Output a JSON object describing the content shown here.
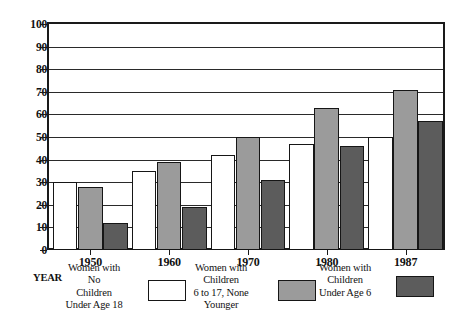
{
  "chart_data": {
    "type": "bar",
    "title": "",
    "subtitle": "",
    "xlabel": "YEAR",
    "ylabel": "",
    "categories": [
      "1950",
      "1960",
      "1970",
      "1980",
      "1987"
    ],
    "ylim": [
      0,
      100
    ],
    "yticks": [
      0,
      10,
      20,
      30,
      40,
      50,
      60,
      70,
      80,
      90,
      100
    ],
    "ytick_labels": [
      "0",
      "10",
      "20",
      "30",
      "40",
      "50",
      "60",
      "70",
      "80",
      "90",
      "100"
    ],
    "grid": true,
    "legend_position": "below-plot",
    "series": [
      {
        "name": "Women with No Children Under Age 18",
        "legend_lines": [
          "Women with",
          "No",
          "Children",
          "Under Age 18"
        ],
        "color": "#ffffff",
        "values": [
          30,
          35,
          42,
          47,
          50
        ]
      },
      {
        "name": "Women with Children 6 to 17, None Younger",
        "legend_lines": [
          "Women with",
          "Children",
          "6 to 17, None",
          "Younger"
        ],
        "color": "#9b9b9b",
        "values": [
          28,
          39,
          50,
          63,
          71
        ]
      },
      {
        "name": "Women with Children Under Age 6",
        "legend_lines": [
          "Women with",
          "Children",
          "Under Age 6"
        ],
        "color": "#5c5c5c",
        "values": [
          12,
          19,
          31,
          46,
          57
        ]
      }
    ]
  },
  "axis": {
    "year_caption": "YEAR"
  }
}
